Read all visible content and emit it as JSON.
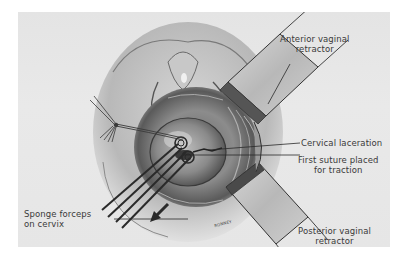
{
  "figure": {
    "type": "surgical illustration",
    "background_color": "#e6e6e6",
    "ink_color": "#3a3a3a"
  },
  "labels": {
    "anterior_retractor": {
      "line1": "Anterior vaginal",
      "line2": "retractor"
    },
    "cervical_laceration": {
      "line1": "Cervical laceration"
    },
    "first_suture": {
      "line1": "First suture placed",
      "line2": "for traction"
    },
    "posterior_retractor": {
      "line1": "Posterior vaginal",
      "line2": "retractor"
    },
    "sponge_forceps": {
      "line1": "Sponge forceps",
      "line2": "on cervix"
    }
  },
  "artist_signature": "RONNEY"
}
